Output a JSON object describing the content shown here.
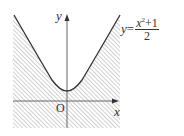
{
  "figure": {
    "equation": {
      "lhs": "y",
      "eq": "=",
      "numerator_var": "x",
      "numerator_exp": "2",
      "numerator_rest": "+1",
      "denominator": "2",
      "text": "y = (x^2 + 1)/2"
    },
    "axes": {
      "x_label": "x",
      "y_label": "y",
      "origin_label": "O"
    },
    "shaded_region": "area below parabola (hatched)",
    "colors": {
      "curve": "#333333",
      "axis": "#666666",
      "hatch": "#9a9a9a"
    }
  }
}
